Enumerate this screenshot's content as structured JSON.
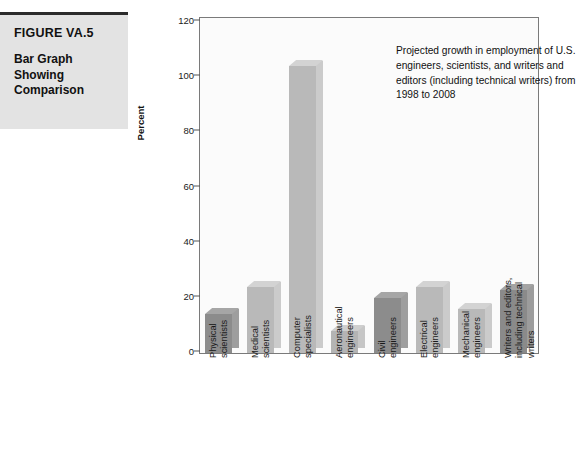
{
  "caption": {
    "figure_number": "FIGURE VA.5",
    "figure_title": "Bar Graph Showing Comparison"
  },
  "chart_data": {
    "type": "bar",
    "title": "",
    "annotation": "Projected growth in employment of U.S. engineers, scientists, and writers and editors (including technical writers) from 1998 to 2008",
    "xlabel": "",
    "ylabel": "Percent",
    "ylim": [
      0,
      120
    ],
    "yticks": [
      0,
      20,
      40,
      60,
      80,
      100,
      120
    ],
    "ytick_labels": [
      "0",
      "20",
      "40",
      "60",
      "80",
      "100",
      "120"
    ],
    "grid": false,
    "legend": "none",
    "categories": [
      "Physical scientists",
      "Medical scientists",
      "Computer specialists",
      "Aeronautical engineers",
      "Civil engineers",
      "Electrical engineers",
      "Mechanical engineers",
      "Writers and editors, including technical writers"
    ],
    "category_lines": [
      [
        "Physical",
        "scientists"
      ],
      [
        "Medical",
        "scientists"
      ],
      [
        "Computer",
        "specialists"
      ],
      [
        "Aeronautical",
        "engineers"
      ],
      [
        "Civil",
        "engineers"
      ],
      [
        "Electrical",
        "engineers"
      ],
      [
        "Mechanical",
        "engineers"
      ],
      [
        "Writers and editors,",
        "including technical",
        "writers"
      ]
    ],
    "values": [
      14,
      24,
      104,
      8,
      20,
      24,
      16,
      23
    ],
    "bar_colors": [
      "#8c8c8c",
      "#b9b9b9",
      "#b9b9b9",
      "#b4b4b4",
      "#8c8c8c",
      "#b9b9b9",
      "#b9b9b9",
      "#8a8a8a"
    ],
    "accent_dark": "#8c8c8c",
    "accent_light": "#b9b9b9",
    "plot_background": "#fbfbfb",
    "axis_color": "#7a7a7a"
  }
}
